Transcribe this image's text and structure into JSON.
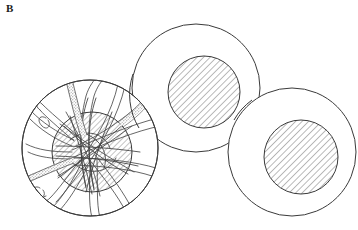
{
  "figure": {
    "panel_label": "B",
    "caption_label_position": "top-left",
    "background_color": "#ffffff",
    "line_color": "#333333",
    "hatch_color": "#555555",
    "stipple_color": "#777777",
    "width": 358,
    "height": 230
  },
  "cells": [
    {
      "id": "cell-left-filamentous",
      "name": "left-cell",
      "cx": 90,
      "cy": 148,
      "r": 68,
      "nucleus": {
        "cx": 92,
        "cy": 152,
        "r": 40,
        "hatched": true,
        "hatch_angle_deg": 45
      },
      "has_filaments": true,
      "filament_count": 14,
      "stippled_filament_count": 2
    },
    {
      "id": "cell-middle",
      "name": "middle-cell",
      "cx": 196,
      "cy": 88,
      "r": 64,
      "nucleus": {
        "cx": 204,
        "cy": 92,
        "r": 36,
        "hatched": true,
        "hatch_angle_deg": 45
      },
      "has_filaments": false,
      "filament_count": 0,
      "stippled_filament_count": 0
    },
    {
      "id": "cell-right",
      "name": "right-cell",
      "cx": 292,
      "cy": 152,
      "r": 64,
      "nucleus": {
        "cx": 301,
        "cy": 157,
        "r": 37,
        "hatched": true,
        "hatch_angle_deg": 45
      },
      "has_filaments": false,
      "filament_count": 0,
      "stippled_filament_count": 0
    }
  ],
  "filaments": [
    {
      "id": "fil-1",
      "label": "filament-up-left-stippled",
      "stippled": true
    },
    {
      "id": "fil-2",
      "label": "filament-up-center",
      "stippled": false
    },
    {
      "id": "fil-3",
      "label": "filament-up-right",
      "stippled": false
    },
    {
      "id": "fil-4",
      "label": "filament-right-upper",
      "stippled": false
    },
    {
      "id": "fil-5",
      "label": "filament-right-stippled",
      "stippled": true
    },
    {
      "id": "fil-6",
      "label": "filament-right-lower",
      "stippled": false
    },
    {
      "id": "fil-7",
      "label": "filament-down-right",
      "stippled": false
    },
    {
      "id": "fil-8",
      "label": "filament-down-center",
      "stippled": false
    },
    {
      "id": "fil-9",
      "label": "filament-down-left",
      "stippled": false
    },
    {
      "id": "fil-10",
      "label": "filament-left-lower-stippled",
      "stippled": true
    },
    {
      "id": "fil-11",
      "label": "filament-left-middle",
      "stippled": false
    },
    {
      "id": "fil-12",
      "label": "filament-left-upper",
      "stippled": false
    },
    {
      "id": "fil-13",
      "label": "filament-hook-left",
      "stippled": false
    },
    {
      "id": "fil-14",
      "label": "filament-hook-lower",
      "stippled": false
    }
  ]
}
